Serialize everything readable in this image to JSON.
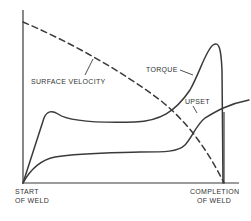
{
  "diagram": {
    "colors": {
      "line": "#3a3a3a",
      "text": "#333333",
      "background": "#ffffff"
    },
    "x_axis": {
      "start_label_line1": "START",
      "start_label_line2": "OF WELD",
      "end_label_line1": "COMPLETION",
      "end_label_line2": "OF WELD"
    },
    "curves": {
      "surface_velocity": {
        "label": "SURFACE VELOCITY",
        "style": "dashed"
      },
      "torque": {
        "label": "TORQUE",
        "style": "solid"
      },
      "upset": {
        "label": "UPSET",
        "style": "solid"
      }
    }
  }
}
